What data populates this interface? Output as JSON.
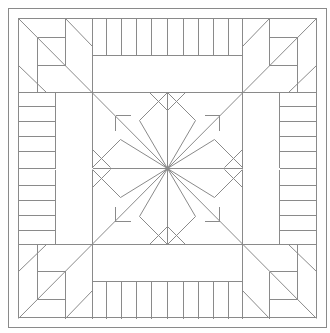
{
  "diagram": {
    "title": "",
    "type": "quilt-block-line-drawing",
    "colors": {
      "background": "#ffffff",
      "stroke": "#8a8a8a"
    },
    "frame": {
      "outer": {
        "x1": 8,
        "y1": 8,
        "x2": 326,
        "y2": 327
      },
      "inner": {
        "x1": 18,
        "y1": 18,
        "x2": 316,
        "y2": 317
      }
    },
    "center": {
      "x": 167,
      "y": 168
    },
    "grid": {
      "a": 18,
      "b": 55,
      "c": 92,
      "d": 130,
      "e": 167,
      "f": 204,
      "g": 242,
      "h": 279,
      "i": 316
    },
    "border_strips": {
      "count_per_side": 10,
      "description": "Vertical/horizontal strip piecing along each side panel"
    },
    "center_star": {
      "points": 8,
      "description": "Eight-pointed LeMoyne-style star with diagonal cross lines"
    },
    "corner_blocks": {
      "count": 4,
      "description": "Nested log-cabin squares with diagonal bars"
    }
  }
}
